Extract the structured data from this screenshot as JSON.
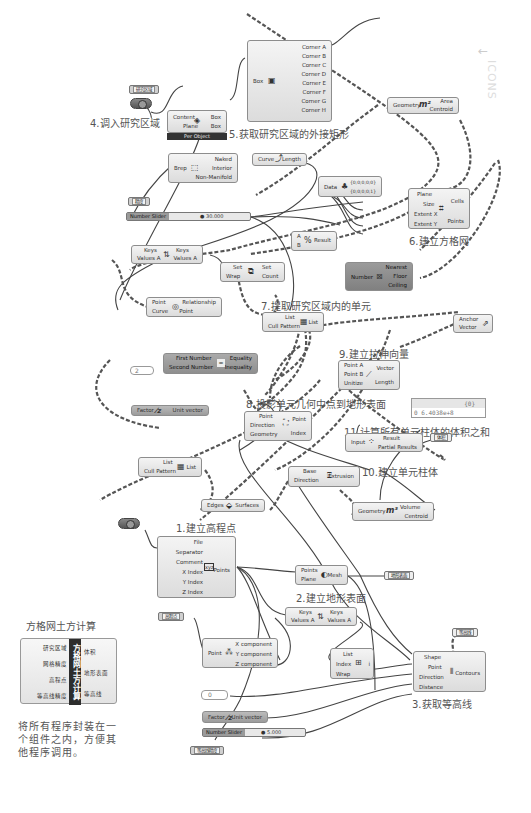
{
  "watermark": {
    "text": "ICONS",
    "arrow": "←"
  },
  "step_labels": {
    "s1": "1.建立高程点",
    "s2": "2.建立地形表面",
    "s3": "3.获取等高线",
    "s4": "4.调入研究区域",
    "s5": "5.获取研究区域的外接矩形",
    "s6": "6.建立方格网",
    "s7": "7.提取研究区域内的单元",
    "s8": "8.投影单元几何中点到地形表面",
    "s9": "9.建立拉伸向量",
    "s10": "10.建立单元柱体",
    "s11": "11.计算所有单元柱体的体积之和"
  },
  "params": {
    "study_area": "研究区域",
    "grid_precision": "精度",
    "elevation_points": "高程点",
    "volume": "体积",
    "terrain_surface": "地形表面",
    "contours": "等高线",
    "contour_precision": "等高线精度"
  },
  "nodes": {
    "box_corners": {
      "input": "Box",
      "outputs": [
        "Corner A",
        "Corner B",
        "Corner C",
        "Corner D",
        "Corner E",
        "Corner F",
        "Corner G",
        "Corner H"
      ]
    },
    "bounding_box": {
      "inputs": [
        "Content",
        "Plane"
      ],
      "outputs": [
        "Box",
        "Box"
      ],
      "mode": "Per Object"
    },
    "area": {
      "input": "Geometry",
      "outputs": [
        "Area",
        "Centroid"
      ]
    },
    "brep_edges": {
      "input": "Brep",
      "outputs": [
        "Naked",
        "Interior",
        "Non-Manifold"
      ]
    },
    "length": {
      "input": "Curve",
      "output": "Length"
    },
    "data_tree": {
      "input": "Data",
      "outputs": [
        "{0;0;0;0;0}",
        "{0;0;0;0;1}"
      ]
    },
    "rect_grid": {
      "inputs": [
        "Plane",
        "Size",
        "Extent X",
        "Extent Y"
      ],
      "outputs": [
        "Cells",
        "Points"
      ]
    },
    "sort_list_1": {
      "inputs": [
        "Keys",
        "Values A"
      ],
      "outputs": [
        "Keys",
        "Values A"
      ]
    },
    "division": {
      "inputs": [
        "A",
        "B"
      ],
      "output": "Result"
    },
    "create_set": {
      "inputs": [
        "Set",
        "Wrap"
      ],
      "outputs": [
        "Set",
        "Count"
      ]
    },
    "round": {
      "input": "Number",
      "outputs": [
        "Nearest",
        "Floor",
        "Ceiling"
      ]
    },
    "point_in_curve": {
      "inputs": [
        "Point",
        "Curve"
      ],
      "outputs": [
        "Relationship",
        "Point"
      ]
    },
    "cull_pattern_1": {
      "inputs": [
        "List",
        "Cull Pattern"
      ],
      "output": "List"
    },
    "equality": {
      "inputs": [
        "First Number",
        "Second Number"
      ],
      "outputs": [
        "Equality",
        "Inequality"
      ]
    },
    "vector_display": {
      "inputs": [
        "Anchor",
        "Vector"
      ]
    },
    "vector_2pt": {
      "inputs": [
        "Point A",
        "Point B",
        "Unitize"
      ],
      "outputs": [
        "Vector",
        "Length"
      ]
    },
    "unit_z_1": {
      "input": "Factor",
      "output": "Unit vector"
    },
    "project_point": {
      "inputs": [
        "Point",
        "Direction",
        "Geometry"
      ],
      "outputs": [
        "Point",
        "Index"
      ]
    },
    "mass_addition": {
      "input": "Input",
      "outputs": [
        "Result",
        "Partial Results"
      ]
    },
    "cull_pattern_2": {
      "inputs": [
        "List",
        "Cull Pattern"
      ],
      "output": "List"
    },
    "extrusion": {
      "inputs": [
        "Base",
        "Direction"
      ],
      "output": "Extrusion"
    },
    "deconstruct_brep": {
      "input": "Edges",
      "output": "Surfaces"
    },
    "volume": {
      "input": "Geometry",
      "outputs": [
        "Volume",
        "Centroid"
      ]
    },
    "read_file": {
      "inputs": [
        "File",
        "Separator",
        "Comment",
        "X Index",
        "Y Index",
        "Z Index"
      ],
      "output": "Points"
    },
    "delaunay_mesh": {
      "inputs": [
        "Points",
        "Plane"
      ],
      "output": "Mesh"
    },
    "sort_list_2": {
      "inputs": [
        "Keys",
        "Values A"
      ],
      "outputs": [
        "Keys",
        "Values A"
      ]
    },
    "deconstruct_point": {
      "input": "Point",
      "outputs": [
        "X component",
        "Y component",
        "Z component"
      ]
    },
    "list_item": {
      "inputs": [
        "List",
        "Index",
        "Wrap"
      ],
      "output": "i"
    },
    "contour": {
      "inputs": [
        "Shape",
        "Point",
        "Direction",
        "Distance"
      ],
      "output": "Contours"
    },
    "unit_z_2": {
      "input": "Factor",
      "output": "Unit vector"
    }
  },
  "sliders": {
    "grid_size": {
      "name": "Number Slider",
      "value": "30.000"
    },
    "contour_distance": {
      "name": "Number Slider",
      "value": "5.000"
    }
  },
  "panels": {
    "equality_value": "2",
    "list_index": "0",
    "volume_result_path": "{0}",
    "volume_result_value": "0 6.4038e+8"
  },
  "cluster": {
    "title": "方格网土方计算",
    "name": "方格网土方计算",
    "inputs": [
      "研究区域",
      "网格精度",
      "高程点",
      "等高线精度"
    ],
    "outputs": [
      "体积",
      "地形表面",
      "等高线"
    ],
    "description": "将所有程序封装在一个组件之内，方便其他程序调用。"
  }
}
